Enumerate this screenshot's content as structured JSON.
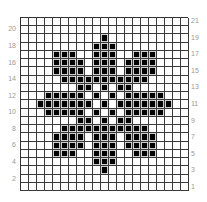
{
  "chart": {
    "title": "",
    "type": "knitting-chart",
    "columns": 21,
    "rows": 21,
    "colors": {
      "filled": "#000000",
      "empty": "#ffffff",
      "grid": "#3a3a3a",
      "label": "#9a9a9a"
    },
    "left_labels": [
      "20",
      "18",
      "16",
      "14",
      "12",
      "10",
      "8",
      "6",
      "4",
      "2"
    ],
    "right_labels": [
      "21",
      "19",
      "17",
      "15",
      "13",
      "11",
      "9",
      "7",
      "5",
      "3",
      "1"
    ],
    "pattern": [
      {
        "row": 21,
        "filled": []
      },
      {
        "row": 20,
        "filled": []
      },
      {
        "row": 19,
        "filled": [
          10
        ]
      },
      {
        "row": 18,
        "filled": [
          9,
          10,
          11
        ]
      },
      {
        "row": 17,
        "filled": [
          4,
          5,
          6,
          9,
          10,
          11,
          14,
          15,
          16
        ]
      },
      {
        "row": 16,
        "filled": [
          4,
          5,
          6,
          7,
          9,
          10,
          11,
          13,
          14,
          15,
          16
        ]
      },
      {
        "row": 15,
        "filled": [
          4,
          5,
          6,
          7,
          9,
          10,
          11,
          13,
          14,
          15,
          16
        ]
      },
      {
        "row": 14,
        "filled": [
          5,
          6,
          7,
          8,
          9,
          10,
          11,
          12,
          13,
          14,
          15
        ]
      },
      {
        "row": 13,
        "filled": [
          7,
          8,
          10,
          12,
          13
        ]
      },
      {
        "row": 12,
        "filled": [
          3,
          4,
          5,
          6,
          7,
          9,
          11,
          13,
          14,
          15,
          16,
          17
        ]
      },
      {
        "row": 11,
        "filled": [
          2,
          3,
          4,
          5,
          6,
          7,
          8,
          10,
          12,
          13,
          14,
          15,
          16,
          17,
          18
        ]
      },
      {
        "row": 10,
        "filled": [
          3,
          4,
          5,
          6,
          7,
          9,
          11,
          13,
          14,
          15,
          16,
          17
        ]
      },
      {
        "row": 9,
        "filled": [
          7,
          8,
          10,
          12,
          13
        ]
      },
      {
        "row": 8,
        "filled": [
          5,
          6,
          7,
          8,
          9,
          10,
          11,
          12,
          13,
          14,
          15
        ]
      },
      {
        "row": 7,
        "filled": [
          4,
          5,
          6,
          7,
          9,
          10,
          11,
          13,
          14,
          15,
          16
        ]
      },
      {
        "row": 6,
        "filled": [
          4,
          5,
          6,
          7,
          9,
          10,
          11,
          13,
          14,
          15,
          16
        ]
      },
      {
        "row": 5,
        "filled": [
          4,
          5,
          6,
          9,
          10,
          11,
          14,
          15,
          16
        ]
      },
      {
        "row": 4,
        "filled": [
          9,
          10,
          11
        ]
      },
      {
        "row": 3,
        "filled": [
          10
        ]
      },
      {
        "row": 2,
        "filled": []
      },
      {
        "row": 1,
        "filled": []
      }
    ]
  }
}
